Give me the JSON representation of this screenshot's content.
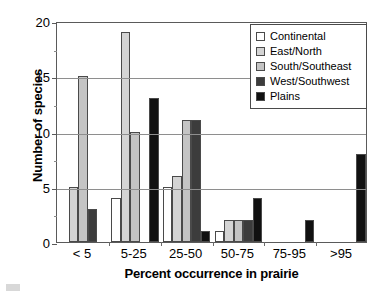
{
  "chart_data": {
    "type": "bar",
    "title": "",
    "xlabel": "Percent occurrence in prairie",
    "ylabel": "Number of species",
    "categories": [
      "< 5",
      "5-25",
      "25-50",
      "50-75",
      "75-95",
      ">95"
    ],
    "ylim": [
      0,
      20
    ],
    "yticks": [
      0,
      5,
      10,
      15,
      20
    ],
    "yticklabels": [
      "0",
      "5",
      "10",
      "15",
      "20"
    ],
    "yminorticks": [
      2.5,
      7.5,
      12.5,
      17.5
    ],
    "grid": "horizontal",
    "legend_position": "top-right",
    "series": [
      {
        "name": "Continental",
        "color": "#ffffff",
        "values": [
          0,
          4,
          5,
          1,
          0,
          0
        ]
      },
      {
        "name": "East/North",
        "color": "#d4d4d4",
        "values": [
          5,
          19,
          6,
          2,
          0,
          0
        ]
      },
      {
        "name": "South/Southeast",
        "color": "#c4c4c4",
        "values": [
          15,
          10,
          11,
          2,
          0,
          0
        ]
      },
      {
        "name": "West/Southwest",
        "color": "#3c3c3c",
        "values": [
          3,
          0,
          11,
          2,
          0,
          0
        ]
      },
      {
        "name": "Plains",
        "color": "#111111",
        "values": [
          0,
          13,
          1,
          4,
          2,
          8
        ]
      }
    ]
  },
  "legend": {
    "items": [
      {
        "label": "Continental",
        "swatch": "#ffffff"
      },
      {
        "label": "East/North",
        "swatch": "#d4d4d4"
      },
      {
        "label": "South/Southeast",
        "swatch": "#c4c4c4"
      },
      {
        "label": "West/Southwest",
        "swatch": "#3c3c3c"
      },
      {
        "label": "Plains",
        "swatch": "#111111"
      }
    ]
  }
}
